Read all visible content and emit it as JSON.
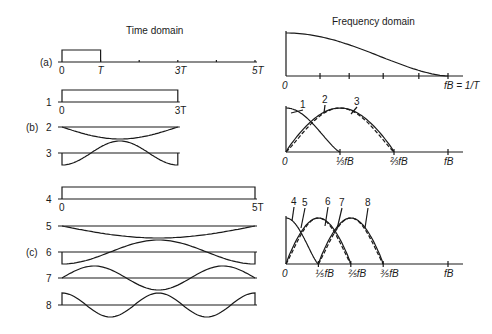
{
  "titles": {
    "time": "Time domain",
    "frequency": "Frequency domain"
  },
  "section_labels": {
    "a": "(a)",
    "b": "(b)",
    "c": "(c)"
  },
  "time_axis": {
    "x0_px": 62,
    "T_px": 38.6,
    "labels_a": [
      "0",
      "T",
      "3T",
      "5T"
    ],
    "row1_labels": [
      "0",
      "3T"
    ],
    "row4_labels": [
      "0",
      "5T"
    ]
  },
  "time_rows": [
    {
      "id": "a",
      "label": "",
      "type": "pulse",
      "width_T": 1,
      "baseline": 62,
      "amp": 12,
      "axis_len_T": 5
    },
    {
      "id": "1",
      "label": "1",
      "type": "pulse",
      "width_T": 3,
      "baseline": 102,
      "amp": 12
    },
    {
      "id": "2",
      "label": "2",
      "type": "sine",
      "width_T": 3,
      "cycles": 0.5,
      "phase": "sin",
      "sign": -1,
      "baseline": 127,
      "amp": 12
    },
    {
      "id": "3",
      "label": "3",
      "type": "cos",
      "width_T": 3,
      "cycles": 1,
      "sign": -1,
      "baseline": 153,
      "amp": 12
    },
    {
      "id": "4",
      "label": "4",
      "type": "pulse",
      "width_T": 5,
      "baseline": 199,
      "amp": 12
    },
    {
      "id": "5",
      "label": "5",
      "type": "sine",
      "width_T": 5,
      "cycles": 0.5,
      "sign": -1,
      "baseline": 226,
      "amp": 12
    },
    {
      "id": "6",
      "label": "6",
      "type": "cos",
      "width_T": 5,
      "cycles": 1,
      "sign": -1,
      "baseline": 252,
      "amp": 12
    },
    {
      "id": "7",
      "label": "7",
      "type": "sine",
      "width_T": 5,
      "cycles": 1.5,
      "sign": 1,
      "baseline": 278,
      "amp": 12
    },
    {
      "id": "8",
      "label": "8",
      "type": "cos",
      "width_T": 5,
      "cycles": 2,
      "sign": 1,
      "baseline": 305,
      "amp": 12
    }
  ],
  "chart_data": [
    {
      "type": "line",
      "title": "Frequency domain (a)",
      "xlabel": "",
      "ylabel": "",
      "x_ticks": [
        "0",
        "fB = 1/T"
      ],
      "description": "Spectrum of single pulse of width T, main lobe decaying from max at 0 to zero at fB = 1/T",
      "series": [
        {
          "name": "(a)",
          "x": [
            0,
            0.2,
            0.4,
            0.6,
            0.8,
            1.0
          ],
          "y": [
            1.0,
            0.94,
            0.76,
            0.5,
            0.23,
            0.0
          ]
        }
      ],
      "xlim": [
        0,
        1.05
      ]
    },
    {
      "type": "line",
      "title": "Frequency domain (b)",
      "x_ticks": [
        "0",
        "1/3 fB",
        "2/3 fB",
        "fB"
      ],
      "series": [
        {
          "name": "1",
          "x": [
            0,
            0.1667,
            0.3333
          ],
          "y": [
            1.0,
            0.5,
            0.0
          ]
        },
        {
          "name": "2",
          "x": [
            0,
            0.1667,
            0.3333,
            0.5,
            0.6667
          ],
          "y": [
            0.0,
            0.71,
            1.0,
            0.71,
            0.0
          ],
          "style": "solid"
        },
        {
          "name": "3",
          "x": [
            0,
            0.1667,
            0.3333,
            0.5,
            0.6667
          ],
          "y": [
            0.0,
            0.67,
            1.0,
            0.67,
            0.0
          ],
          "style": "dashed"
        }
      ],
      "xlim": [
        0,
        1.05
      ]
    },
    {
      "type": "line",
      "title": "Frequency domain (c)",
      "x_ticks": [
        "0",
        "1/5 fB",
        "2/5 fB",
        "3/5 fB",
        "fB"
      ],
      "series": [
        {
          "name": "4",
          "x": [
            0,
            0.1,
            0.2
          ],
          "y": [
            1.0,
            0.5,
            0.0
          ]
        },
        {
          "name": "5",
          "x": [
            0,
            0.1,
            0.2,
            0.3,
            0.4
          ],
          "y": [
            0.0,
            0.71,
            1.0,
            0.71,
            0.0
          ],
          "style": "solid"
        },
        {
          "name": "6",
          "x": [
            0,
            0.1,
            0.2,
            0.3,
            0.4
          ],
          "y": [
            0.0,
            0.67,
            1.0,
            0.67,
            0.0
          ],
          "style": "dashed"
        },
        {
          "name": "7",
          "x": [
            0.2,
            0.3,
            0.4,
            0.5,
            0.6
          ],
          "y": [
            0.0,
            0.71,
            1.0,
            0.71,
            0.0
          ],
          "style": "solid"
        },
        {
          "name": "8",
          "x": [
            0.2,
            0.3,
            0.4,
            0.5,
            0.6
          ],
          "y": [
            0.0,
            0.67,
            1.0,
            0.67,
            0.0
          ],
          "style": "dashed"
        }
      ],
      "xlim": [
        0,
        1.05
      ]
    }
  ],
  "freq_panels": [
    {
      "id": "a",
      "x0": 286,
      "fB_px": 448,
      "x_end": 463,
      "baseline": 76,
      "top": 33,
      "ticks": [
        0.21,
        0.39,
        0.6,
        0.82,
        1.0
      ],
      "tick_labels": [
        {
          "text": "0",
          "at": 0
        },
        {
          "text": "fB = 1/T",
          "at": 1.0,
          "ital": true
        }
      ]
    },
    {
      "id": "b",
      "x0": 286,
      "fB_px": 448,
      "x_end": 463,
      "baseline": 152,
      "top": 108,
      "ticks": [
        0.3333,
        0.6667,
        1.0
      ],
      "tick_labels": [
        {
          "text": "0",
          "at": 0
        },
        {
          "text": "⅓fB",
          "at": 0.3333
        },
        {
          "text": "⅔fB",
          "at": 0.6667
        },
        {
          "text": "fB",
          "at": 1.0
        }
      ],
      "curve_labels": [
        {
          "text": "1",
          "x": 300,
          "y": 108,
          "tx": 291,
          "ty": 113
        },
        {
          "text": "2",
          "x": 322,
          "y": 103,
          "tx": 324,
          "ty": 113
        },
        {
          "text": "3",
          "x": 354,
          "y": 105,
          "tx": 351,
          "ty": 114
        }
      ]
    },
    {
      "id": "c",
      "x0": 286,
      "fB_px": 448,
      "x_end": 463,
      "baseline": 264,
      "top": 218,
      "ticks": [
        0.2,
        0.4,
        0.6,
        1.0
      ],
      "tick_labels": [
        {
          "text": "0",
          "at": 0
        },
        {
          "text": "⅕fB",
          "at": 0.2
        },
        {
          "text": "⅖fB",
          "at": 0.4
        },
        {
          "text": "⅗fB",
          "at": 0.6
        },
        {
          "text": "fB",
          "at": 1.0
        }
      ],
      "curve_labels": [
        {
          "text": "4",
          "x": 291,
          "y": 205,
          "tx": 292,
          "ty": 221
        },
        {
          "text": "5",
          "x": 302,
          "y": 206,
          "tx": 301,
          "ty": 228
        },
        {
          "text": "6",
          "x": 325,
          "y": 205,
          "tx": 325,
          "ty": 226
        },
        {
          "text": "7",
          "x": 339,
          "y": 206,
          "tx": 337,
          "ty": 229
        },
        {
          "text": "8",
          "x": 365,
          "y": 206,
          "tx": 365,
          "ty": 228
        }
      ]
    }
  ]
}
